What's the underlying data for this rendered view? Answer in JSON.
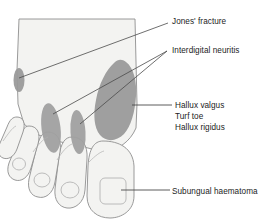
{
  "figure": {
    "colors": {
      "background": "#ffffff",
      "skin_fill": "#f3f3f1",
      "skin_outline": "#8e8e8e",
      "lesion_fill": "#9a9a9a",
      "lesion_fill_light": "#a8a8a8",
      "leader_line": "#4a4a4a",
      "text": "#1c1c1c",
      "nail_outline": "#b4b4b4"
    }
  },
  "labels": {
    "jones_fracture": "Jones' fracture",
    "interdigital_neuritis": "Interdigital neuritis",
    "hallux_valgus": "Hallux valgus",
    "turf_toe": "Turf toe",
    "hallux_rigidus": "Hallux rigidus",
    "subungual_haematoma": "Subungual haematoma"
  },
  "annotations": [
    {
      "id": "jones-fracture",
      "label": "Jones' fracture",
      "target": "base of fifth metatarsal",
      "marker": "small-gray-oval",
      "leader": {
        "from": [
          168,
          23
        ],
        "to": [
          19,
          78
        ]
      }
    },
    {
      "id": "interdigital-neuritis",
      "label": "Interdigital neuritis",
      "target": "second and third web spaces",
      "marker": "two-gray-ovals",
      "leader": [
        {
          "from": [
            167,
            51
          ],
          "to": [
            60,
            112
          ]
        },
        {
          "from": [
            167,
            51
          ],
          "to": [
            88,
            120
          ]
        }
      ]
    },
    {
      "id": "hallux-valgus-group",
      "label": "Hallux valgus / Turf toe / Hallux rigidus",
      "target": "first metatarsophalangeal joint",
      "marker": "large-gray-blob",
      "leader": {
        "from": [
          172,
          105
        ],
        "to": [
          133,
          105
        ]
      }
    },
    {
      "id": "subungual-haematoma",
      "label": "Subungual haematoma",
      "target": "hallux nail",
      "marker": "nail-outline",
      "leader": {
        "from": [
          170,
          190
        ],
        "to": [
          122,
          190
        ]
      }
    }
  ]
}
